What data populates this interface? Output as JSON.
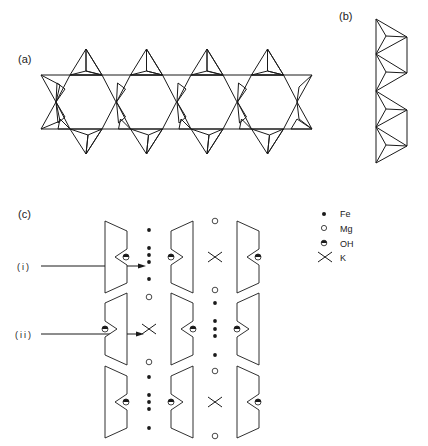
{
  "figure": {
    "panel_a": {
      "label": "(a)",
      "description": "double chain of corner-sharing tetrahedra (hexagonal rings)"
    },
    "panel_b": {
      "label": "(b)",
      "description": "side view of tetrahedral chain"
    },
    "panel_c": {
      "label": "(c)",
      "arrows": [
        {
          "label": "(i)"
        },
        {
          "label": "(ii)"
        }
      ]
    },
    "legend": [
      {
        "symbol": "filled-dot",
        "label": "Fe"
      },
      {
        "symbol": "open-circle",
        "label": "Mg"
      },
      {
        "symbol": "half-filled-circle",
        "label": "OH"
      },
      {
        "symbol": "cross",
        "label": "K"
      }
    ]
  },
  "colors": {
    "line": "#1a1a1a",
    "background": "#ffffff"
  }
}
